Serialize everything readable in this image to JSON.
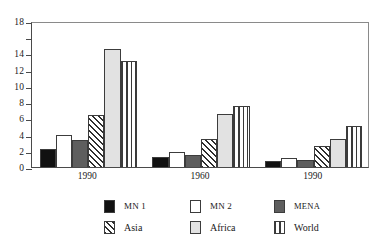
{
  "chart_data": {
    "type": "bar",
    "title": "",
    "subtitle": "",
    "xlabel": "",
    "ylabel": "",
    "categories": [
      "1990",
      "1960",
      "1990"
    ],
    "series": [
      {
        "name": "MN 1",
        "pattern": "solid-black",
        "values": [
          2.2,
          1.2,
          0.8
        ]
      },
      {
        "name": "MN 2",
        "pattern": "solid-white",
        "values": [
          4.0,
          1.9,
          1.1
        ]
      },
      {
        "name": "MENA",
        "pattern": "solid-dark-gray",
        "values": [
          3.3,
          1.5,
          0.9
        ]
      },
      {
        "name": "Asia",
        "pattern": "diagonal-hatch",
        "values": [
          6.4,
          3.5,
          2.6
        ]
      },
      {
        "name": "Africa",
        "pattern": "solid-light-gray",
        "values": [
          14.5,
          6.5,
          3.5
        ]
      },
      {
        "name": "World",
        "pattern": "vertical-lines",
        "values": [
          13.1,
          7.5,
          5.1
        ]
      }
    ],
    "ylim": [
      0,
      18
    ],
    "yticks": [
      0,
      2,
      4,
      6,
      8,
      10,
      12,
      14,
      16,
      18
    ],
    "ytick_labels": [
      "0",
      "2",
      "4",
      "6",
      "8",
      "10",
      "12",
      "14",
      "",
      "18"
    ],
    "grid": false,
    "legend_position": "bottom"
  },
  "legend": {
    "rows": [
      [
        {
          "label": "MN 1",
          "swatch": "solid-black"
        },
        {
          "label": "MN 2",
          "swatch": "solid-white"
        },
        {
          "label": "MENA",
          "swatch": "solid-dark-gray"
        }
      ],
      [
        {
          "label": "Asia",
          "swatch": "diagonal-hatch"
        },
        {
          "label": "Africa",
          "swatch": "solid-light-gray"
        },
        {
          "label": "World",
          "swatch": "vertical-lines"
        }
      ]
    ]
  },
  "colors": {
    "mn1": "#111111",
    "mn2": "#ffffff",
    "mena": "#5e5e5e",
    "asia": "#2e2e2e",
    "africa": "#e2e2e2",
    "world": "#3a3a3a",
    "axis": "#4a4a4a",
    "background": "#ffffff"
  }
}
